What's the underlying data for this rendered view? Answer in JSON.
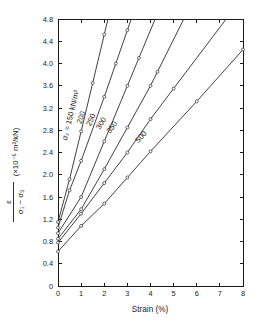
{
  "chart_data": {
    "type": "line",
    "title": "",
    "xlabel": "Strain (%)",
    "ylabel_numerator": "ε",
    "ylabel_denominator": "σ₁ − σ₃",
    "ylabel_units": "(×10⁻⁵ m²/kN)",
    "xlim": [
      0,
      8
    ],
    "ylim": [
      0,
      4.8
    ],
    "xticks": [
      0,
      1,
      2,
      3,
      4,
      5,
      6,
      7,
      8
    ],
    "xtick_labels": [
      "0",
      "1",
      "2",
      "3",
      "4",
      "5",
      "6",
      "7",
      "8"
    ],
    "yticks": [
      0,
      0.4,
      0.8,
      1.2,
      1.6,
      2.0,
      2.4,
      2.8,
      3.2,
      3.6,
      4.0,
      4.4,
      4.8
    ],
    "ytick_labels": [
      "0",
      "0.4",
      "0.8",
      "1.2",
      "1.6",
      "2.0",
      "2.4",
      "2.8",
      "3.2",
      "3.6",
      "4.0",
      "4.4",
      "4.8"
    ],
    "grid": false,
    "legend_position": "inline-on-curves",
    "marker": "open-circle",
    "line_color": "#2b2b2b",
    "axis_color": "#1a1a1a",
    "background": "#ffffff",
    "series": [
      {
        "name": "150",
        "label": "σ₃ = 150 kN/m²",
        "label_x": 0.75,
        "label_y": 3.05,
        "x": [
          0,
          0.5,
          1.0,
          1.5,
          2.0
        ],
        "values": [
          1.15,
          1.92,
          2.78,
          3.65,
          4.52
        ]
      },
      {
        "name": "200",
        "label": "200",
        "label_x": 1.2,
        "label_y": 3.0,
        "x": [
          0,
          0.5,
          1.0,
          2.0,
          2.5,
          3.0
        ],
        "values": [
          1.05,
          1.72,
          2.25,
          3.4,
          4.0,
          4.6
        ]
      },
      {
        "name": "250",
        "label": "250",
        "label_x": 1.62,
        "label_y": 2.95,
        "x": [
          0,
          1.0,
          2.0,
          3.0,
          3.5
        ],
        "values": [
          0.95,
          1.6,
          2.6,
          3.6,
          4.1
        ]
      },
      {
        "name": "300",
        "label": "300",
        "label_x": 2.05,
        "label_y": 2.88,
        "x": [
          0,
          1.0,
          2.0,
          3.0,
          4.0,
          4.3
        ],
        "values": [
          0.85,
          1.38,
          2.1,
          2.85,
          3.6,
          3.85
        ]
      },
      {
        "name": "350",
        "label": "350",
        "label_x": 2.5,
        "label_y": 2.8,
        "x": [
          0,
          1.0,
          2.0,
          3.0,
          4.0,
          5.0
        ],
        "values": [
          0.78,
          1.3,
          1.85,
          2.4,
          3.0,
          3.55
        ]
      },
      {
        "name": "500",
        "label": "500",
        "label_x": 3.75,
        "label_y": 2.62,
        "x": [
          0,
          1.0,
          2.0,
          3.0,
          4.0,
          6.0,
          8.0
        ],
        "values": [
          0.62,
          1.08,
          1.48,
          1.95,
          2.42,
          3.32,
          4.25
        ]
      }
    ]
  },
  "axes": {
    "plot_left_px": 58,
    "plot_right_px": 243,
    "plot_top_px": 19,
    "plot_bottom_px": 286
  }
}
